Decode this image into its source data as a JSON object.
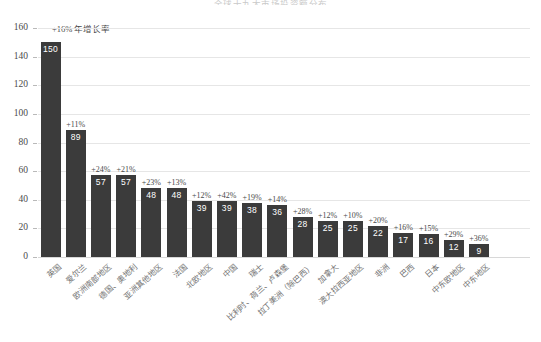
{
  "chart_data": {
    "type": "bar",
    "title": "全球十九大市场投资额分布",
    "xlabel": "",
    "ylabel": "",
    "ylim": [
      0,
      160
    ],
    "yticks": [
      0,
      20,
      40,
      60,
      80,
      100,
      120,
      140,
      160
    ],
    "grid": true,
    "legend": false,
    "annotation": "+16% 年增长率",
    "bar_color": "#3b3b3b",
    "categories": [
      "英国",
      "爱尔兰",
      "欧洲南部地区",
      "德国、奥地利",
      "亚洲其他地区",
      "法国",
      "北欧地区",
      "中国",
      "瑞士",
      "比利时、荷兰、卢森堡",
      "拉丁美洲（除巴西）",
      "加拿大",
      "澳大拉西亚地区",
      "非洲",
      "巴西",
      "日本",
      "中东欧地区",
      "中东地区"
    ],
    "values": [
      150,
      89,
      57,
      57,
      48,
      48,
      39,
      39,
      38,
      36,
      28,
      25,
      25,
      22,
      17,
      16,
      12,
      9
    ],
    "growth_labels": [
      "+16%",
      "+11%",
      "+24%",
      "+21%",
      "+23%",
      "+13%",
      "+12%",
      "+42%",
      "+19%",
      "+14%",
      "+28%",
      "+12%",
      "+10%",
      "+20%",
      "+16%",
      "+15%",
      "+29%",
      "+36%"
    ]
  }
}
